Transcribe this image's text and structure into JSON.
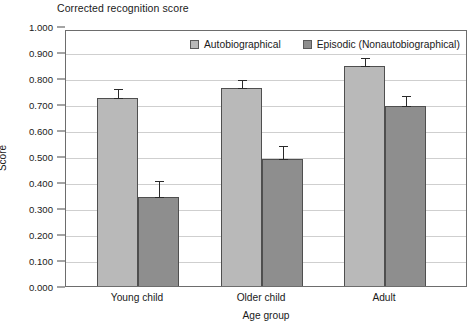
{
  "chart_data": {
    "type": "bar",
    "title": "Corrected recognition score",
    "xlabel": "Age group",
    "ylabel": "Score",
    "categories": [
      "Young child",
      "Older child",
      "Adult"
    ],
    "series": [
      {
        "name": "Autobiographical",
        "color": "#b9b9b9",
        "values": [
          0.73,
          0.77,
          0.855
        ],
        "errors": [
          0.035,
          0.03,
          0.03
        ]
      },
      {
        "name": "Episodic (Nonautobiographical)",
        "color": "#8e8e8e",
        "values": [
          0.35,
          0.495,
          0.7
        ],
        "errors": [
          0.06,
          0.05,
          0.04
        ]
      }
    ],
    "ylim": [
      0.0,
      1.0
    ],
    "yticks": [
      "0.000",
      "0.100",
      "0.200",
      "0.300",
      "0.400",
      "0.500",
      "0.600",
      "0.700",
      "0.800",
      "0.900",
      "1.000"
    ],
    "ytick_values": [
      0.0,
      0.1,
      0.2,
      0.3,
      0.4,
      0.5,
      0.6,
      0.7,
      0.8,
      0.9,
      1.0
    ],
    "grid": true,
    "legend_position": "top-center",
    "error_bars": true
  },
  "legend": {
    "entries": [
      {
        "label": "Autobiographical",
        "swatch": "#b9b9b9"
      },
      {
        "label": "Episodic (Nonautobiographical)",
        "swatch": "#8e8e8e"
      }
    ]
  }
}
